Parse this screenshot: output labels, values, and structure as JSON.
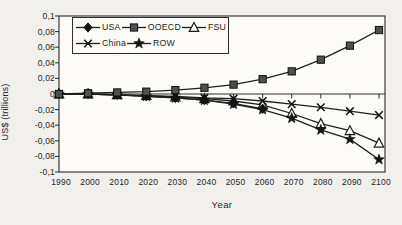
{
  "figure": {
    "y_axis_title": "US$ (trillions)",
    "x_axis_title": "Year",
    "y_tick_labels": [
      "0,1",
      "0,08",
      "0,06",
      "0,04",
      "0,02",
      "0",
      "-0,02",
      "-0,04",
      "-0,06",
      "-0,08",
      "-0,1"
    ],
    "x_tick_labels": [
      "1990",
      "2000",
      "2010",
      "2020",
      "2030",
      "2040",
      "2050",
      "2060",
      "2070",
      "2080",
      "2090",
      "2100"
    ]
  },
  "legend": {
    "rows": [
      [
        {
          "name": "USA",
          "marker": "diamond"
        },
        {
          "name": "OOECD",
          "marker": "square"
        },
        {
          "name": "FSU",
          "marker": "triangle-open"
        }
      ],
      [
        {
          "name": "China",
          "marker": "x"
        },
        {
          "name": "ROW",
          "marker": "star"
        }
      ]
    ]
  },
  "chart_data": {
    "type": "line",
    "x": [
      1990,
      2000,
      2010,
      2020,
      2030,
      2040,
      2050,
      2060,
      2070,
      2080,
      2090,
      2100
    ],
    "series": [
      {
        "name": "USA",
        "marker": "diamond",
        "values": [
          0,
          0,
          -0.001,
          -0.003,
          -0.005,
          -0.008,
          -0.012,
          -0.019,
          null,
          null,
          null,
          null
        ]
      },
      {
        "name": "OOECD",
        "marker": "square",
        "values": [
          0,
          0.001,
          0.002,
          0.003,
          0.005,
          0.008,
          0.012,
          0.019,
          0.029,
          0.044,
          0.062,
          0.082
        ]
      },
      {
        "name": "FSU",
        "marker": "triangle-open",
        "values": [
          0,
          0,
          -0.001,
          -0.002,
          -0.004,
          -0.006,
          -0.009,
          -0.014,
          -0.025,
          -0.038,
          -0.047,
          -0.063
        ]
      },
      {
        "name": "China",
        "marker": "x",
        "values": [
          0,
          0,
          -0.001,
          -0.002,
          -0.003,
          -0.005,
          -0.006,
          -0.009,
          -0.013,
          -0.017,
          -0.022,
          -0.027
        ]
      },
      {
        "name": "ROW",
        "marker": "star",
        "values": [
          0,
          0,
          -0.001,
          -0.003,
          -0.005,
          -0.008,
          -0.013,
          -0.02,
          -0.031,
          -0.046,
          -0.058,
          -0.084
        ]
      }
    ],
    "title": "",
    "xlabel": "Year",
    "ylabel": "US$ (trillions)",
    "xlim": [
      1990,
      2100
    ],
    "ylim": [
      -0.1,
      0.1
    ],
    "y_tick_step": 0.02,
    "grid": false,
    "legend_position": "top-left-inside",
    "colors": {
      "line": "#1f1f1f",
      "marker_fill": "#141414",
      "square_fill": "#4f4f4f",
      "triangle_fill": "#fdfdfa",
      "plot_background": "#fcfbf8",
      "page_background": "#f1f0ed",
      "text": "#262626"
    }
  }
}
